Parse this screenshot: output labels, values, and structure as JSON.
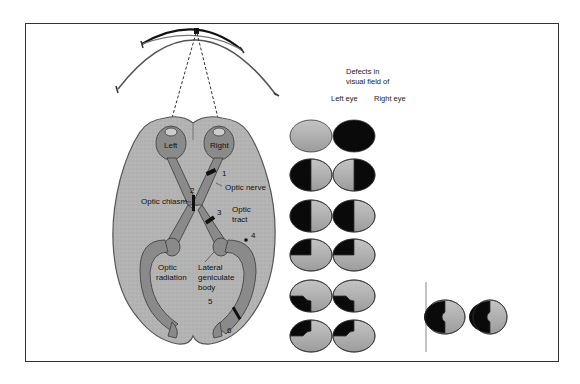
{
  "diagram": {
    "visual_field_arc": "visual field",
    "eyes": {
      "left": "Left",
      "right": "Right"
    },
    "labels": {
      "optic_nerve": "Optic nerve",
      "optic_chiasm": "Optic chiasm",
      "optic_tract_1": "Optic",
      "optic_tract_2": "tract",
      "optic_radiation_1": "Optic",
      "optic_radiation_2": "radiation",
      "lgb_1": "Lateral",
      "lgb_2": "geniculate",
      "lgb_3": "body"
    },
    "lesion_numbers": [
      "1",
      "2",
      "3",
      "4",
      "5",
      "6"
    ],
    "defects_panel": {
      "header_1": "Defects in",
      "header_2": "visual field of",
      "col_left": "Left eye",
      "col_right": "Right eye",
      "rows": [
        {
          "num": "1",
          "left": "none",
          "right": "full blindness"
        },
        {
          "num": "2",
          "left": "temporal (left) half",
          "right": "temporal (right) half"
        },
        {
          "num": "3",
          "left": "left half",
          "right": "left half"
        },
        {
          "num": "4",
          "left": "upper-left quadrant",
          "right": "upper-left quadrant"
        },
        {
          "num": "5",
          "left": "lower-left partial",
          "right": "lower-left partial"
        },
        {
          "num": "6",
          "left": "upper-left partial",
          "right": "upper-left partial"
        }
      ],
      "combined": "left homonymous hemianopia with macular sparing"
    },
    "colors": {
      "field_gray": "#a8a8a8",
      "defect_black": "#0a0a0a",
      "brain_gray": "#b0b0b0",
      "pathway_gray": "#7a7a7a"
    }
  }
}
